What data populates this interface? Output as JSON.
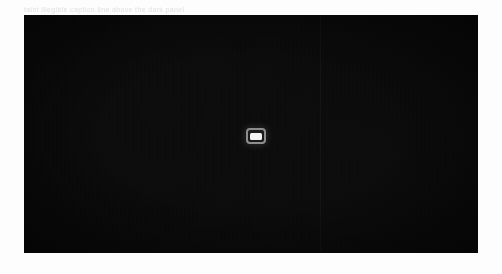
{
  "canvas": {
    "width": 502,
    "height": 274,
    "background_color": "#fdfdfd"
  },
  "header": {
    "caption": "faint illegible caption line above the dark panel",
    "color": "#c8c8c8"
  },
  "panel": {
    "label": "dark media viewport",
    "background_color": "#0a0a0a",
    "seam_color": "#2a2a2a"
  },
  "center_badge": {
    "label": "media placeholder badge",
    "border_color": "#8d8d8d",
    "fill_color": "#f2f2f2",
    "background_color": "#1a1a1a"
  }
}
